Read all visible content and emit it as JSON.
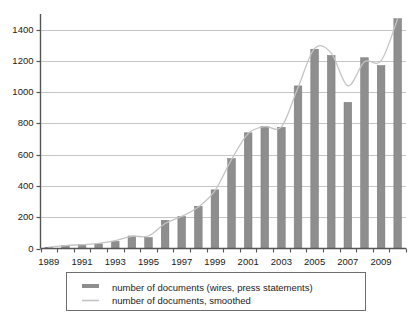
{
  "chart_data": {
    "type": "bar",
    "title": "",
    "subtitle": "",
    "xlabel": "",
    "ylabel": "",
    "grid": true,
    "xlim": [
      1988.5,
      2010.5
    ],
    "ylim": [
      0,
      1500
    ],
    "yticks": [
      0,
      200,
      400,
      600,
      800,
      1000,
      1200,
      1400
    ],
    "ytick_labels": [
      "0",
      "200",
      "400",
      "600",
      "800",
      "1000",
      "1200",
      "1400"
    ],
    "categories": [
      1989,
      1990,
      1991,
      1992,
      1993,
      1994,
      1995,
      1996,
      1997,
      1998,
      1999,
      2000,
      2001,
      2002,
      2003,
      2004,
      2005,
      2006,
      2007,
      2008,
      2009,
      2010
    ],
    "xtick_labels": [
      "1989",
      "",
      "1991",
      "",
      "1993",
      "",
      "1995",
      "",
      "1997",
      "",
      "1999",
      "",
      "2001",
      "",
      "2003",
      "",
      "2005",
      "",
      "2007",
      "",
      "2009",
      ""
    ],
    "series": [
      {
        "name": "number of documents (wires, press statements)",
        "type": "bar",
        "color": "#8e8e8e",
        "values": [
          8,
          18,
          25,
          30,
          45,
          80,
          70,
          180,
          205,
          270,
          375,
          575,
          740,
          780,
          775,
          1040,
          1275,
          1235,
          935,
          1220,
          1170,
          1470
        ]
      },
      {
        "name": "number of documents, smoothed",
        "type": "line",
        "color": "#c4c4c4",
        "values": [
          8,
          18,
          25,
          33,
          50,
          78,
          80,
          160,
          205,
          265,
          370,
          570,
          735,
          780,
          778,
          1030,
          1280,
          1250,
          1040,
          1195,
          1200,
          1470
        ]
      }
    ],
    "legend": {
      "position": "below",
      "entries": [
        {
          "label": "number of documents (wires, press statements)",
          "marker": "bar-swatch",
          "color": "#8e8e8e"
        },
        {
          "label": "number of documents, smoothed",
          "marker": "line-swatch",
          "color": "#c4c4c4"
        }
      ]
    }
  },
  "colors": {
    "bar": "#8e8e8e",
    "bar_edge": "#777777",
    "line": "#c4c4c4",
    "grid": "#b8b8b8",
    "axis": "#555555",
    "text": "#1a1a1a",
    "legend_border": "#6e6e6e",
    "background": "#ffffff"
  }
}
